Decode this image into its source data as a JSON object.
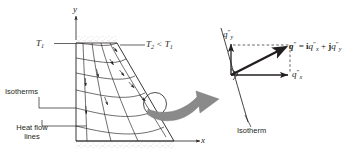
{
  "figure": {
    "background_color": "#ffffff",
    "line_color": "#231f20",
    "arrow_fill": "#8a8a8a"
  },
  "left_panel": {
    "axes": {
      "y_label": "y",
      "x_label": "x"
    },
    "temperature_labels": {
      "hot": "T",
      "hot_sub": "1",
      "cold": "T",
      "cold_sub": "2",
      "cold_relation": " < T",
      "cold_relation_sub": "1"
    },
    "callouts": [
      {
        "name": "isotherms",
        "line1": "Isotherms",
        "line2": ""
      },
      {
        "name": "heat-flow-lines",
        "line1": "Heat flow",
        "line2": "lines"
      }
    ]
  },
  "right_panel": {
    "isotherm_label": "Isotherm",
    "vector_y_label": "q",
    "vector_y_sup": "″",
    "vector_y_sub": "y",
    "vector_x_label": "q",
    "vector_x_sup": "″",
    "vector_x_sub": "x",
    "equation": {
      "lhs": "q",
      "lhs_sup": "″",
      "equals": " = ",
      "i_unit": "i",
      "term_x": "q",
      "term_x_sup": "″",
      "term_x_sub": "x",
      "plus": " + ",
      "j_unit": "j",
      "term_y": "q",
      "term_y_sup": "″",
      "term_y_sub": "y",
      "full_text": "q″ = iq″x + jq″y"
    }
  }
}
